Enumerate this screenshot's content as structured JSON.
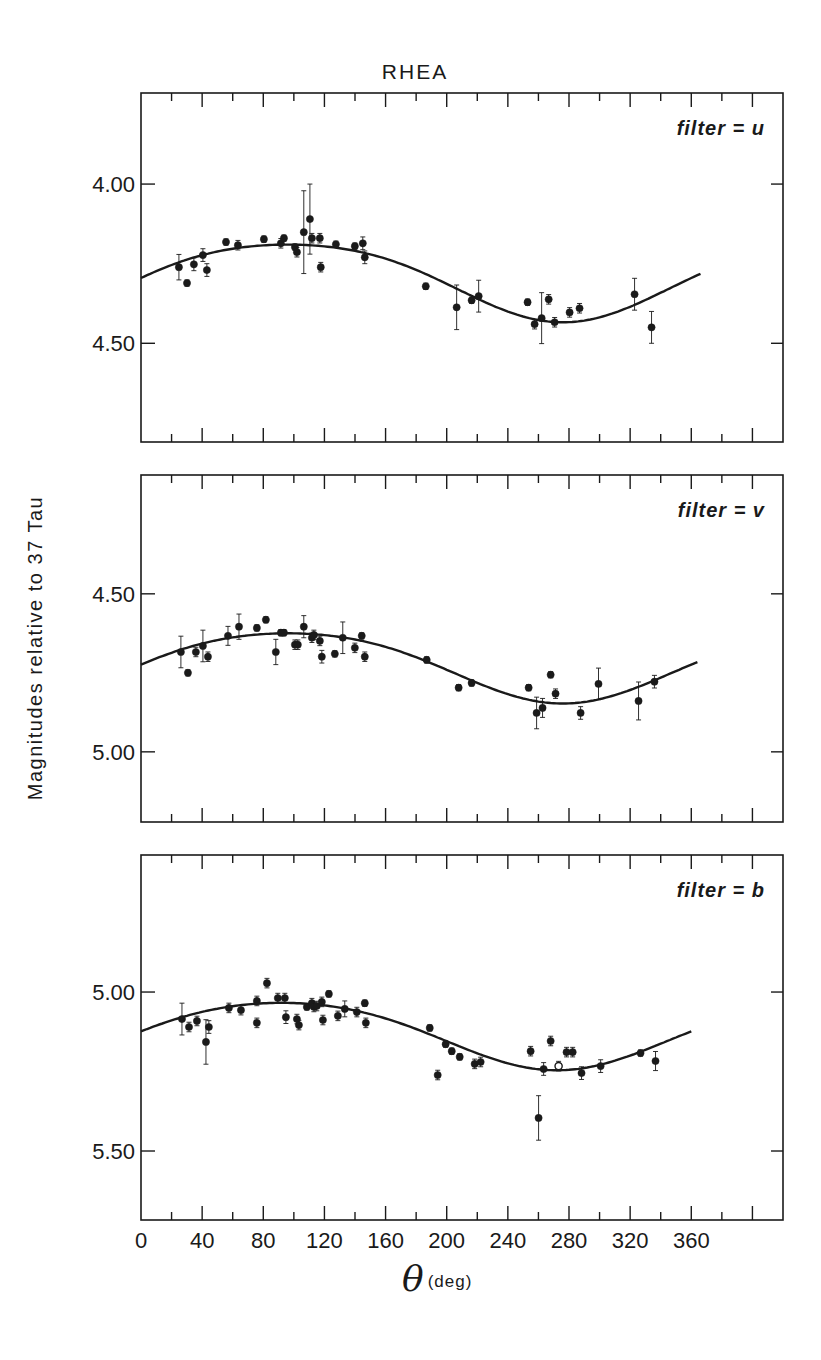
{
  "chart_data": [
    {
      "type": "scatter",
      "title": "RHEA",
      "panel_label": "filter = u",
      "xlabel": "θ (deg)",
      "ylabel": "Magnitudes relative to 37 Tau",
      "xlim": [
        0,
        420
      ],
      "ylim": [
        3.714,
        4.81
      ],
      "y_inverted": true,
      "yticks": [
        4.0,
        4.5
      ],
      "ytick_labels": [
        "4.00",
        "4.50"
      ],
      "points": [
        [
          24.8,
          4.261
        ],
        [
          30.1,
          4.311
        ],
        [
          34.6,
          4.252
        ],
        [
          40.5,
          4.223
        ],
        [
          43.1,
          4.27
        ],
        [
          55.6,
          4.182
        ],
        [
          63.4,
          4.192
        ],
        [
          80.4,
          4.173
        ],
        [
          91.5,
          4.186
        ],
        [
          93.5,
          4.17
        ],
        [
          100.7,
          4.198
        ],
        [
          102.0,
          4.214
        ],
        [
          106.5,
          4.151
        ],
        [
          110.5,
          4.11
        ],
        [
          111.8,
          4.17
        ],
        [
          117.0,
          4.17
        ],
        [
          117.6,
          4.261
        ],
        [
          127.5,
          4.189
        ],
        [
          139.9,
          4.195
        ],
        [
          145.1,
          4.186
        ],
        [
          146.4,
          4.23
        ],
        [
          186.3,
          4.321
        ],
        [
          206.5,
          4.387
        ],
        [
          216.3,
          4.365
        ],
        [
          220.9,
          4.352
        ],
        [
          252.9,
          4.371
        ],
        [
          257.5,
          4.44
        ],
        [
          262.1,
          4.421
        ],
        [
          266.7,
          4.362
        ],
        [
          270.6,
          4.434
        ],
        [
          280.4,
          4.403
        ],
        [
          286.9,
          4.39
        ],
        [
          322.9,
          4.346
        ],
        [
          334.0,
          4.45
        ]
      ],
      "errors": [
        0.04,
        0.01,
        0.02,
        0.02,
        0.02,
        0.01,
        0.015,
        0.01,
        0.015,
        0.01,
        0.01,
        0.015,
        0.13,
        0.11,
        0.015,
        0.015,
        0.015,
        0.01,
        0.01,
        0.02,
        0.02,
        0.01,
        0.07,
        0.01,
        0.05,
        0.01,
        0.015,
        0.08,
        0.015,
        0.015,
        0.015,
        0.015,
        0.05,
        0.05
      ],
      "fit_curve": {
        "x_range": [
          0,
          366
        ],
        "mean": 4.297,
        "amplitude": 0.122,
        "phase_deg": 96,
        "second_amp": 0.015
      }
    },
    {
      "type": "scatter",
      "panel_label": "filter = v",
      "xlim": [
        0,
        420
      ],
      "ylim": [
        4.124,
        5.222
      ],
      "y_inverted": true,
      "yticks": [
        4.5,
        5.0
      ],
      "ytick_labels": [
        "4.50",
        "5.00"
      ],
      "points": [
        [
          26.1,
          4.684
        ],
        [
          30.7,
          4.75
        ],
        [
          35.9,
          4.684
        ],
        [
          40.5,
          4.665
        ],
        [
          43.8,
          4.699
        ],
        [
          56.9,
          4.633
        ],
        [
          64.1,
          4.604
        ],
        [
          75.8,
          4.608
        ],
        [
          81.7,
          4.582
        ],
        [
          88.2,
          4.684
        ],
        [
          91.5,
          4.623
        ],
        [
          93.5,
          4.623
        ],
        [
          100.7,
          4.661
        ],
        [
          102.6,
          4.661
        ],
        [
          106.5,
          4.604
        ],
        [
          111.8,
          4.639
        ],
        [
          113.1,
          4.63
        ],
        [
          117.0,
          4.649
        ],
        [
          118.3,
          4.699
        ],
        [
          126.8,
          4.69
        ],
        [
          132.0,
          4.639
        ],
        [
          139.9,
          4.671
        ],
        [
          144.4,
          4.633
        ],
        [
          146.4,
          4.699
        ],
        [
          186.9,
          4.709
        ],
        [
          207.8,
          4.797
        ],
        [
          216.3,
          4.782
        ],
        [
          253.6,
          4.797
        ],
        [
          258.8,
          4.877
        ],
        [
          262.7,
          4.861
        ],
        [
          268.0,
          4.756
        ],
        [
          271.2,
          4.816
        ],
        [
          287.6,
          4.877
        ],
        [
          299.3,
          4.785
        ],
        [
          325.5,
          4.839
        ],
        [
          335.9,
          4.778
        ]
      ],
      "errors": [
        0.05,
        0.01,
        0.015,
        0.05,
        0.015,
        0.03,
        0.04,
        0.01,
        0.01,
        0.04,
        0.01,
        0.01,
        0.015,
        0.015,
        0.035,
        0.015,
        0.015,
        0.015,
        0.02,
        0.01,
        0.05,
        0.015,
        0.01,
        0.015,
        0.01,
        0.01,
        0.01,
        0.01,
        0.05,
        0.03,
        0.01,
        0.015,
        0.02,
        0.05,
        0.06,
        0.02
      ],
      "fit_curve": {
        "x_range": [
          0,
          364
        ],
        "mean": 4.724,
        "amplitude": 0.111,
        "phase_deg": 96,
        "second_amp": 0.012
      }
    },
    {
      "type": "scatter",
      "panel_label": "filter = b",
      "xlim": [
        0,
        420
      ],
      "ylim": [
        4.569,
        5.717
      ],
      "y_inverted": true,
      "yticks": [
        5.0,
        5.5
      ],
      "ytick_labels": [
        "5.00",
        "5.50"
      ],
      "points": [
        [
          26.8,
          5.085
        ],
        [
          31.4,
          5.11
        ],
        [
          36.6,
          5.091
        ],
        [
          42.5,
          5.157
        ],
        [
          44.4,
          5.11
        ],
        [
          57.5,
          5.05
        ],
        [
          65.4,
          5.057
        ],
        [
          75.8,
          5.028
        ],
        [
          75.8,
          5.097
        ],
        [
          82.4,
          4.972
        ],
        [
          89.5,
          5.019
        ],
        [
          94.1,
          5.019
        ],
        [
          94.8,
          5.079
        ],
        [
          102.0,
          5.085
        ],
        [
          103.3,
          5.104
        ],
        [
          108.5,
          5.047
        ],
        [
          111.8,
          5.035
        ],
        [
          113.1,
          5.047
        ],
        [
          115.0,
          5.044
        ],
        [
          118.3,
          5.031
        ],
        [
          119.0,
          5.088
        ],
        [
          122.9,
          5.006
        ],
        [
          128.8,
          5.075
        ],
        [
          133.3,
          5.053
        ],
        [
          141.2,
          5.063
        ],
        [
          146.4,
          5.035
        ],
        [
          147.1,
          5.097
        ],
        [
          188.9,
          5.113
        ],
        [
          194.1,
          5.261
        ],
        [
          199.3,
          5.164
        ],
        [
          203.3,
          5.186
        ],
        [
          208.5,
          5.204
        ],
        [
          218.3,
          5.226
        ],
        [
          222.2,
          5.22
        ],
        [
          254.9,
          5.186
        ],
        [
          260.1,
          5.396
        ],
        [
          263.4,
          5.242
        ],
        [
          268.0,
          5.154
        ],
        [
          273.2,
          5.233
        ],
        [
          278.4,
          5.189
        ],
        [
          282.4,
          5.189
        ],
        [
          288.2,
          5.255
        ],
        [
          300.7,
          5.233
        ],
        [
          326.8,
          5.192
        ],
        [
          336.6,
          5.217
        ]
      ],
      "errors": [
        0.05,
        0.015,
        0.015,
        0.07,
        0.02,
        0.015,
        0.015,
        0.015,
        0.015,
        0.015,
        0.015,
        0.015,
        0.02,
        0.015,
        0.015,
        0.01,
        0.015,
        0.015,
        0.015,
        0.015,
        0.015,
        0.01,
        0.015,
        0.025,
        0.015,
        0.01,
        0.015,
        0.01,
        0.015,
        0.01,
        0.01,
        0.01,
        0.015,
        0.015,
        0.015,
        0.07,
        0.02,
        0.015,
        0.015,
        0.015,
        0.015,
        0.02,
        0.02,
        0.01,
        0.03
      ],
      "open_marker_index": 38,
      "fit_curve": {
        "x_range": [
          0,
          360
        ],
        "mean": 5.13,
        "amplitude": 0.106,
        "phase_deg": 92,
        "second_amp": 0.01
      }
    }
  ],
  "figure": {
    "title": "RHEA",
    "ylabel": "Magnitudes relative to 37 Tau",
    "xlabel_symbol": "θ",
    "xlabel_unit": "(deg)",
    "xticks": [
      0,
      40,
      80,
      120,
      160,
      200,
      240,
      280,
      320,
      360
    ],
    "xtick_labels": [
      "0",
      "40",
      "80",
      "120",
      "160",
      "200",
      "240",
      "280",
      "320",
      "360"
    ],
    "panels": [
      {
        "label": "filter = u"
      },
      {
        "label": "filter = v"
      },
      {
        "label": "filter = b"
      }
    ]
  }
}
